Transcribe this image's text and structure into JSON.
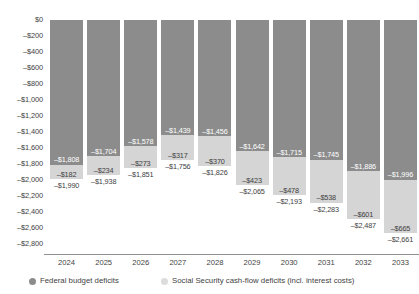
{
  "chart_data": {
    "type": "bar",
    "title": "",
    "subtitle": "",
    "xlabel": "",
    "ylabel": "",
    "stacked": true,
    "grid": false,
    "legend_position": "bottom",
    "ylim": [
      -2800,
      0
    ],
    "ytick_step": 200,
    "categories": [
      "2024",
      "2025",
      "2026",
      "2027",
      "2028",
      "2029",
      "2030",
      "2031",
      "2032",
      "2033"
    ],
    "ytick_labels": [
      "$0",
      "–$200",
      "–$400",
      "–$600",
      "–$800",
      "–$1,000",
      "–$1,200",
      "–$1,400",
      "–$1,600",
      "–$1,800",
      "–$2,000",
      "–$2,200",
      "–$2,400",
      "–$2,600",
      "–$2,800"
    ],
    "ytick_values": [
      0,
      -200,
      -400,
      -600,
      -800,
      -1000,
      -1200,
      -1400,
      -1600,
      -1800,
      -2000,
      -2200,
      -2400,
      -2600,
      -2800
    ],
    "series": [
      {
        "name": "Federal budget deficits",
        "color": "#8c8c8c",
        "values": [
          -1808,
          -1704,
          -1578,
          -1439,
          -1456,
          -1642,
          -1715,
          -1745,
          -1886,
          -1996
        ],
        "labels": [
          "–$1,808",
          "–$1,704",
          "–$1,578",
          "–$1,439",
          "–$1,456",
          "–$1,642",
          "–$1,715",
          "–$1,745",
          "–$1,886",
          "–$1,996"
        ]
      },
      {
        "name": "Social Security cash-flow deficits (incl. interest costs)",
        "color": "#d5d5d5",
        "values": [
          -182,
          -234,
          -273,
          -317,
          -370,
          -423,
          -478,
          -538,
          -601,
          -665
        ],
        "labels": [
          "–$182",
          "–$234",
          "–$273",
          "–$317",
          "–$370",
          "–$423",
          "–$478",
          "–$538",
          "–$601",
          "–$665"
        ]
      }
    ],
    "totals": [
      -1990,
      -1938,
      -1851,
      -1756,
      -1826,
      -2065,
      -2193,
      -2283,
      -2487,
      -2661
    ],
    "total_labels": [
      "–$1,990",
      "–$1,938",
      "–$1,851",
      "–$1,756",
      "–$1,826",
      "–$2,065",
      "–$2,193",
      "–$2,283",
      "–$2,487",
      "–$2,661"
    ]
  },
  "legend": {
    "items": [
      {
        "label": "Federal budget deficits"
      },
      {
        "label": "Social Security cash-flow deficits (incl. interest costs)"
      }
    ]
  }
}
